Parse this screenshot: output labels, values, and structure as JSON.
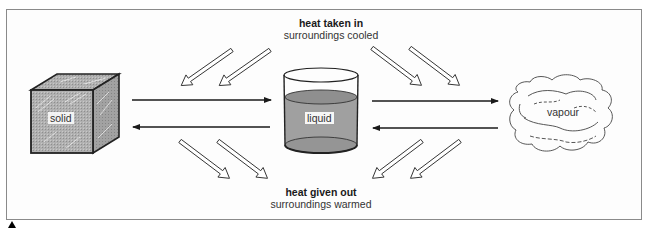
{
  "diagram": {
    "states": [
      {
        "id": "solid",
        "label": "solid",
        "shape": "cube"
      },
      {
        "id": "liquid",
        "label": "liquid",
        "shape": "beaker"
      },
      {
        "id": "vapour",
        "label": "vapour",
        "shape": "cloud"
      }
    ],
    "captions": {
      "top": {
        "bold": "heat taken in",
        "normal": "surroundings cooled"
      },
      "bottom": {
        "bold": "heat given out",
        "normal": "surroundings warmed"
      }
    },
    "transitions": [
      {
        "from": "solid",
        "to": "liquid",
        "direction": "right",
        "heat": "taken in"
      },
      {
        "from": "liquid",
        "to": "solid",
        "direction": "left",
        "heat": "given out"
      },
      {
        "from": "liquid",
        "to": "vapour",
        "direction": "right",
        "heat": "taken in"
      },
      {
        "from": "vapour",
        "to": "liquid",
        "direction": "left",
        "heat": "given out"
      }
    ],
    "colors": {
      "frame": "#8a8a8a",
      "line": "#1a1a1a",
      "solid_fill": "#a9a9a9",
      "liquid_fill": "#9d9d9d",
      "text": "#1a1a1a"
    }
  }
}
